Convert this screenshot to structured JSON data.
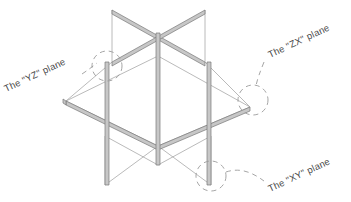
{
  "figure": {
    "background_color": "#ffffff",
    "stroke_color": "#8c8c8c",
    "bar_fill_color": "#c9c9c9",
    "bar_edge_color": "#7a7a7a",
    "thin_line_color": "#a6a6a6",
    "dash_color": "#9b9b9b",
    "label_color": "#4a4a4a"
  },
  "callouts": [
    {
      "id": "yz",
      "label": "The \"YZ\" plane",
      "rotation_deg": -25,
      "text_x": 6,
      "text_y": 92,
      "circle_cx": 107,
      "circle_cy": 66,
      "circle_r": 15,
      "leader": "M 86 71 C 92 67, 96 66, 100 64"
    },
    {
      "id": "zx",
      "label": "The \"ZX\" plane",
      "rotation_deg": -25,
      "text_x": 262,
      "text_y": 56,
      "circle_cx": 253,
      "circle_cy": 100,
      "circle_r": 15,
      "leader": "M 262 62 C 259 72, 256 80, 255 85"
    },
    {
      "id": "xy",
      "label": "The \"XY\" plane",
      "rotation_deg": -25,
      "text_x": 266,
      "text_y": 196,
      "circle_cx": 211,
      "circle_cy": 176,
      "circle_r": 15,
      "leader": "M 226 173 C 240 169, 252 175, 262 182"
    }
  ],
  "geometry": {
    "note": "Isometric projection of XY, YZ and ZX planes intersecting at the origin",
    "planes": [
      "XY",
      "YZ",
      "ZX"
    ]
  }
}
